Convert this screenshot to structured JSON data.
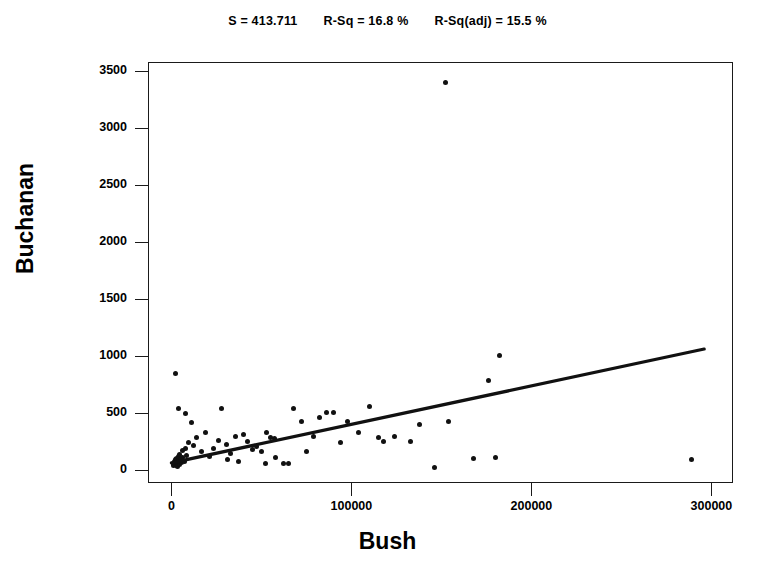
{
  "chart_data": {
    "type": "scatter",
    "title": "",
    "xlabel": "Bush",
    "ylabel": "Buchanan",
    "xlim": [
      -13000,
      312000
    ],
    "ylim": [
      -112,
      3580
    ],
    "xticks": [
      0,
      100000,
      200000,
      300000
    ],
    "xtick_labels": [
      "0",
      "100000",
      "200000",
      "300000"
    ],
    "yticks": [
      0,
      500,
      1000,
      1500,
      2000,
      2500,
      3000,
      3500
    ],
    "ytick_labels": [
      "0",
      "500",
      "1000",
      "1500",
      "2000",
      "2500",
      "3000",
      "3500"
    ],
    "grid": false,
    "legend": false,
    "fit_statistics": {
      "s_label": "S = 413.711",
      "r_sq_label": "R-Sq = 16.8 %",
      "r_sq_adj_label": "R-Sq(adj) = 15.5 %",
      "s": 413.711,
      "r_sq": 16.8,
      "r_sq_adj": 15.5
    },
    "regression_line": {
      "type": "linear-fit",
      "slope": 0.00337,
      "intercept": 65,
      "x_start": 0,
      "x_end": 296000,
      "y_start": 65,
      "y_end": 1063
    },
    "series": [
      {
        "name": "Counties",
        "marker": "filled-circle",
        "color": "#111111",
        "points": [
          [
            1100,
            60
          ],
          [
            1400,
            40
          ],
          [
            1800,
            75
          ],
          [
            2000,
            55
          ],
          [
            2300,
            90
          ],
          [
            2600,
            45
          ],
          [
            2900,
            70
          ],
          [
            3100,
            105
          ],
          [
            3400,
            35
          ],
          [
            3700,
            120
          ],
          [
            4000,
            85
          ],
          [
            4300,
            50
          ],
          [
            4700,
            140
          ],
          [
            5200,
            95
          ],
          [
            5600,
            65
          ],
          [
            6000,
            170
          ],
          [
            6400,
            110
          ],
          [
            7000,
            80
          ],
          [
            7600,
            190
          ],
          [
            8200,
            130
          ],
          [
            2500,
            845
          ],
          [
            4200,
            540
          ],
          [
            7800,
            500
          ],
          [
            11000,
            420
          ],
          [
            9500,
            245
          ],
          [
            12500,
            215
          ],
          [
            14000,
            290
          ],
          [
            16500,
            160
          ],
          [
            19000,
            335
          ],
          [
            21000,
            120
          ],
          [
            23500,
            190
          ],
          [
            26000,
            265
          ],
          [
            28000,
            545
          ],
          [
            30500,
            230
          ],
          [
            33000,
            150
          ],
          [
            35500,
            300
          ],
          [
            31000,
            95
          ],
          [
            37000,
            75
          ],
          [
            40000,
            310
          ],
          [
            42500,
            255
          ],
          [
            45000,
            185
          ],
          [
            47500,
            205
          ],
          [
            50000,
            160
          ],
          [
            52500,
            60
          ],
          [
            55000,
            285
          ],
          [
            57500,
            275
          ],
          [
            53000,
            330
          ],
          [
            58000,
            110
          ],
          [
            62000,
            60
          ],
          [
            65000,
            55
          ],
          [
            68000,
            540
          ],
          [
            72000,
            430
          ],
          [
            75000,
            160
          ],
          [
            79000,
            300
          ],
          [
            82000,
            465
          ],
          [
            86000,
            505
          ],
          [
            90000,
            510
          ],
          [
            94000,
            245
          ],
          [
            98000,
            430
          ],
          [
            104000,
            330
          ],
          [
            110000,
            560
          ],
          [
            115000,
            290
          ],
          [
            118000,
            250
          ],
          [
            124000,
            300
          ],
          [
            133000,
            250
          ],
          [
            138000,
            405
          ],
          [
            146000,
            20
          ],
          [
            152000,
            3400
          ],
          [
            154000,
            430
          ],
          [
            168000,
            105
          ],
          [
            176000,
            790
          ],
          [
            182000,
            1005
          ],
          [
            180000,
            110
          ],
          [
            289000,
            90
          ]
        ]
      }
    ]
  },
  "figure": {
    "background": "#ffffff",
    "foreground": "#111111"
  }
}
